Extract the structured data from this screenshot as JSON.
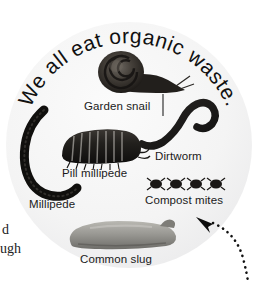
{
  "page": {
    "background_color": "#ffffff",
    "plate_color": "#f4f4f4"
  },
  "headline": {
    "text": "We all eat organic waste.",
    "style": "curved-arc-top"
  },
  "creatures": [
    {
      "id": "garden-snail",
      "label": "Garden snail",
      "icon": "snail-icon",
      "color": "#2e2b28"
    },
    {
      "id": "dirtworm",
      "label": "Dirtworm",
      "icon": "worm-icon",
      "color": "#1b1a18"
    },
    {
      "id": "pill-millipede",
      "label": "Pill millipede",
      "icon": "pill-millipede-icon",
      "color": "#1a1817"
    },
    {
      "id": "millipede",
      "label": "Millipede",
      "icon": "millipede-icon",
      "color": "#14130f"
    },
    {
      "id": "compost-mites",
      "label": "Compost mites",
      "icon": "mites-icon",
      "color": "#191715",
      "count": 4
    },
    {
      "id": "common-slug",
      "label": "Common slug",
      "icon": "slug-icon",
      "color": "#8a8a86"
    }
  ],
  "annotation": {
    "pointer": "dotted-curved-arrow",
    "direction": "up-left"
  },
  "margin_text": {
    "line1": "d",
    "line2": "ugh"
  }
}
